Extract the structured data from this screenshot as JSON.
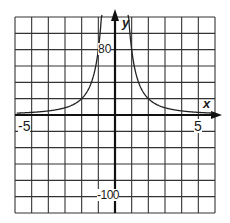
{
  "chart_data": {
    "type": "line",
    "title": "",
    "xlabel": "x",
    "ylabel": "y",
    "xlim": [
      -6,
      6
    ],
    "ylim": [
      -120,
      120
    ],
    "grid": true,
    "x_tick_labels": [
      {
        "value": -5,
        "label": "-5"
      },
      {
        "value": 5,
        "label": "5"
      }
    ],
    "y_tick_labels": [
      {
        "value": 80,
        "label": "80"
      },
      {
        "value": -100,
        "label": "-100"
      }
    ],
    "x_grid_step": 1,
    "y_grid_step": 20,
    "series": [
      {
        "name": "y = 80/x^2",
        "x": [
          -5.8,
          -5,
          -4,
          -3,
          -2,
          -1.5,
          -1.2,
          -1,
          -0.85,
          0.85,
          1,
          1.2,
          1.5,
          2,
          3,
          4,
          5,
          5.8
        ],
        "values": [
          2.4,
          3.2,
          5,
          8.9,
          20,
          35.6,
          55.6,
          80,
          110,
          110,
          80,
          55.6,
          35.6,
          20,
          8.9,
          5,
          3.2,
          2.4
        ]
      }
    ],
    "asymptote": {
      "x": 0
    }
  },
  "labels": {
    "x_axis": "x",
    "y_axis": "y",
    "x_neg5": "-5",
    "x_pos5": "5",
    "y_80": "80",
    "y_neg100": "-100"
  },
  "colors": {
    "grid": "#333333",
    "axis": "#111111",
    "curve": "#222222"
  }
}
